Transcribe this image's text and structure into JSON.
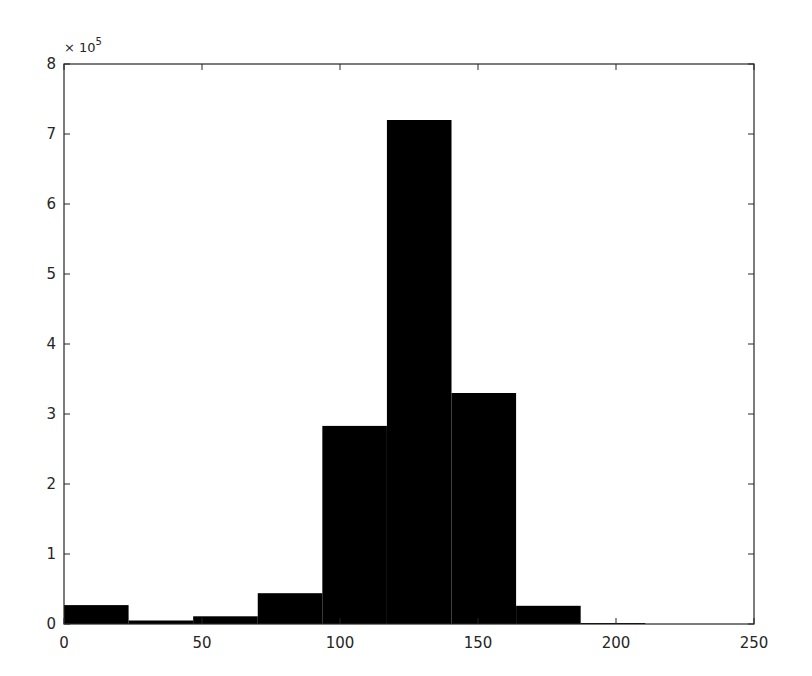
{
  "chart_data": {
    "type": "bar",
    "subtype": "histogram",
    "title": "",
    "xlabel": "",
    "ylabel": "",
    "y_multiplier_label": "× 10",
    "y_multiplier_exponent": "5",
    "xlim": [
      0,
      250
    ],
    "ylim": [
      0,
      800000
    ],
    "x_ticks": [
      0,
      50,
      100,
      150,
      200,
      250
    ],
    "y_ticks": [
      0,
      1,
      2,
      3,
      4,
      5,
      6,
      7,
      8
    ],
    "grid": false,
    "legend": null,
    "bin_edges": [
      0,
      23.4,
      46.8,
      70.2,
      93.6,
      117,
      140.4,
      163.8,
      187.2,
      210.6,
      234
    ],
    "values": [
      27000,
      5000,
      11000,
      44000,
      283000,
      720000,
      330000,
      26000,
      1000,
      0
    ],
    "bar_color": "#000000",
    "axis_color": "#262626"
  }
}
